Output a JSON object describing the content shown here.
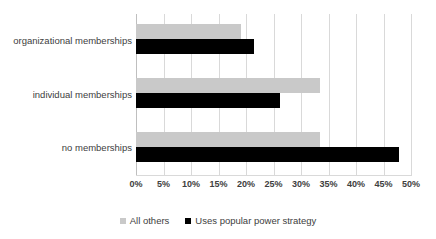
{
  "chart_data": {
    "type": "bar",
    "orientation": "horizontal",
    "title": "",
    "subtitle": "",
    "xlabel": "",
    "ylabel": "",
    "xlim": [
      0,
      50
    ],
    "xtick_step": 5,
    "grid": true,
    "legend_position": "bottom",
    "categories": [
      "organizational memberships",
      "individual memberships",
      "no memberships"
    ],
    "tick_labels": [
      "0%",
      "5%",
      "10%",
      "15%",
      "20%",
      "25%",
      "30%",
      "35%",
      "40%",
      "45%",
      "50%"
    ],
    "tick_values": [
      0,
      5,
      10,
      15,
      20,
      25,
      30,
      35,
      40,
      45,
      50
    ],
    "series": [
      {
        "name": "All others",
        "color": "#c9c9c9",
        "values": [
          19.0,
          33.4,
          33.4
        ]
      },
      {
        "name": "Uses popular power strategy",
        "color": "#000000",
        "values": [
          21.5,
          26.2,
          47.8
        ]
      }
    ]
  },
  "colors": {
    "gridline": "#d9d9d9",
    "text": "#404040",
    "background": "#ffffff",
    "series_all_others": "#c9c9c9",
    "series_popular_power": "#000000"
  }
}
